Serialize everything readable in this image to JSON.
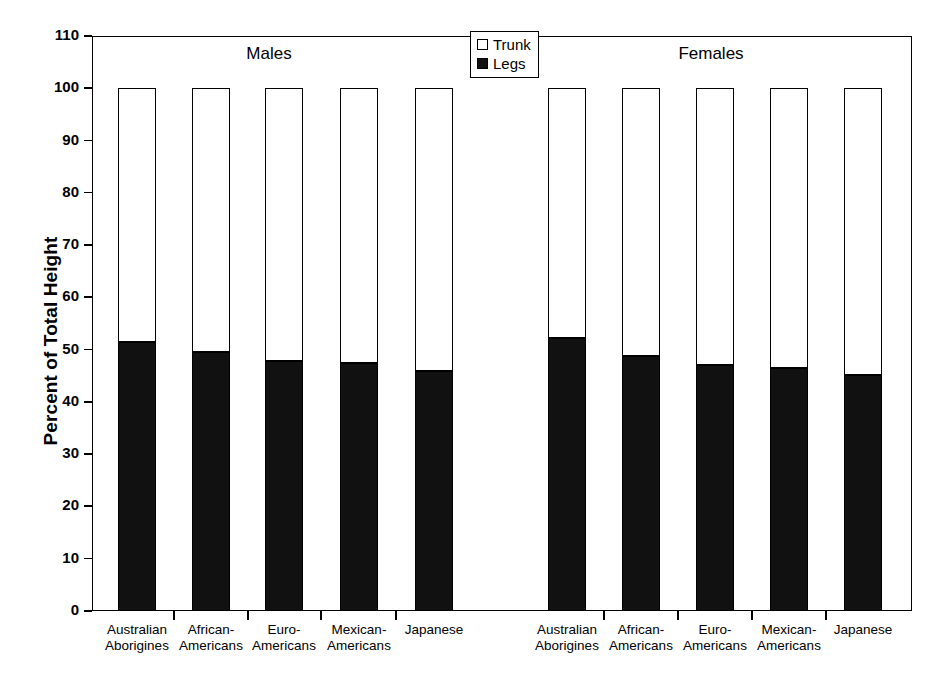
{
  "chart_data": {
    "type": "bar",
    "subtype": "stacked-percent",
    "title": "",
    "xlabel": "",
    "ylabel": "Percent of Total Height",
    "ylim": [
      0,
      110
    ],
    "ytick_values": [
      0,
      10,
      20,
      30,
      40,
      50,
      60,
      70,
      80,
      90,
      100,
      110
    ],
    "ytick_labels": [
      "0",
      "10",
      "20",
      "30",
      "40",
      "50",
      "60",
      "70",
      "80",
      "90",
      "100",
      "110"
    ],
    "grid": false,
    "legend": {
      "position": "top-center",
      "entries": [
        {
          "label": "Trunk",
          "color": "#ffffff",
          "swatch": "open-square"
        },
        {
          "label": "Legs",
          "color": "#111111",
          "swatch": "filled-square"
        }
      ]
    },
    "groups": [
      {
        "name": "Males",
        "categories": [
          "Australian Aborigines",
          "African-Americans",
          "Euro-Americans",
          "Mexican-Americans",
          "Japanese"
        ],
        "category_lines": [
          [
            "Australian",
            "Aborigines"
          ],
          [
            "African-",
            "Americans"
          ],
          [
            "Euro-",
            "Americans"
          ],
          [
            "Mexican-",
            "Americans"
          ],
          [
            "Japanese",
            ""
          ]
        ],
        "series": [
          {
            "name": "Legs",
            "values": [
              51.5,
              49.6,
              47.8,
              47.4,
              46.0
            ]
          },
          {
            "name": "Trunk",
            "values": [
              48.5,
              50.4,
              52.2,
              52.6,
              54.0
            ]
          }
        ],
        "totals": [
          100,
          100,
          100,
          100,
          100
        ]
      },
      {
        "name": "Females",
        "categories": [
          "Australian Aborigines",
          "African-Americans",
          "Euro-Americans",
          "Mexican-Americans",
          "Japanese"
        ],
        "category_lines": [
          [
            "Australian",
            "Aborigines"
          ],
          [
            "African-",
            "Americans"
          ],
          [
            "Euro-",
            "Americans"
          ],
          [
            "Mexican-",
            "Americans"
          ],
          [
            "Japanese",
            ""
          ]
        ],
        "series": [
          {
            "name": "Legs",
            "values": [
              52.2,
              48.8,
              47.1,
              46.4,
              45.1
            ]
          },
          {
            "name": "Trunk",
            "values": [
              47.8,
              51.2,
              52.9,
              53.6,
              54.9
            ]
          }
        ],
        "totals": [
          100,
          100,
          100,
          100,
          100
        ]
      }
    ]
  },
  "axis": {
    "y_title": "Percent of Total Height"
  },
  "colors": {
    "legs": "#111111",
    "trunk": "#ffffff",
    "axis": "#000000",
    "background": "#ffffff"
  }
}
